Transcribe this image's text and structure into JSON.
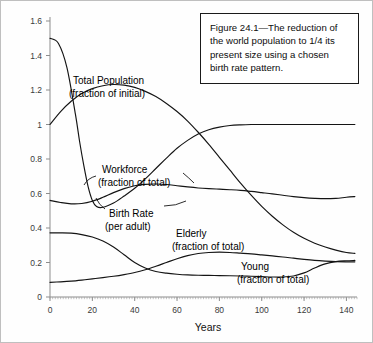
{
  "figure": {
    "caption": "Figure 24.1—The reduction of the world population to 1/4 its present size using a chosen birth rate pattern."
  },
  "chart_data": {
    "type": "line",
    "title": "",
    "xlabel": "Years",
    "ylabel": "",
    "xlim": [
      0,
      145
    ],
    "ylim": [
      0,
      1.6
    ],
    "xticks": [
      0,
      20,
      40,
      60,
      80,
      100,
      120,
      140
    ],
    "xtick_labels": [
      "0",
      "20",
      "40",
      "60",
      "80",
      "100",
      "120",
      "140"
    ],
    "yticks": [
      0,
      0.2,
      0.4,
      0.6,
      0.8,
      1,
      1.2,
      1.4,
      1.6
    ],
    "ytick_labels": [
      "0",
      "0.2",
      "0.4",
      "0.6",
      "0.8",
      "1",
      "1.2",
      "1.4",
      "1.6"
    ],
    "grid": false,
    "legend_position": "inline-annotations",
    "line_color": "#141414",
    "series": [
      {
        "name": "Birth Rate (per adult)",
        "label_line1": "Birth Rate",
        "label_line2": "(per adult)",
        "x": [
          0,
          4,
          8,
          12,
          14,
          16,
          18,
          20,
          22,
          25,
          30,
          35,
          40,
          45,
          50,
          55,
          60,
          65,
          70,
          75,
          80,
          85,
          90,
          95,
          100,
          110,
          120,
          130,
          140,
          144
        ],
        "y": [
          1.5,
          1.47,
          1.33,
          1.06,
          0.9,
          0.76,
          0.64,
          0.56,
          0.525,
          0.52,
          0.545,
          0.585,
          0.63,
          0.685,
          0.745,
          0.805,
          0.862,
          0.908,
          0.945,
          0.97,
          0.985,
          0.994,
          0.998,
          1.0,
          1.0,
          1.0,
          1.0,
          1.0,
          1.0,
          1.0
        ]
      },
      {
        "name": "Total Population (fraction of initial)",
        "label_line1": "Total Population",
        "label_line2": "(fraction of initial)",
        "x": [
          0,
          5,
          10,
          15,
          20,
          25,
          30,
          35,
          40,
          45,
          50,
          55,
          60,
          65,
          70,
          75,
          80,
          85,
          90,
          95,
          100,
          105,
          110,
          115,
          120,
          125,
          130,
          135,
          140,
          144
        ],
        "y": [
          1.0,
          1.075,
          1.135,
          1.18,
          1.208,
          1.225,
          1.232,
          1.228,
          1.215,
          1.192,
          1.162,
          1.122,
          1.075,
          1.02,
          0.955,
          0.885,
          0.81,
          0.735,
          0.66,
          0.59,
          0.525,
          0.468,
          0.418,
          0.375,
          0.34,
          0.312,
          0.29,
          0.272,
          0.258,
          0.253
        ]
      },
      {
        "name": "Workforce (fraction of total)",
        "label_line1": "Workforce",
        "label_line2": "(fraction of total)",
        "x": [
          0,
          5,
          10,
          15,
          20,
          25,
          30,
          35,
          40,
          45,
          50,
          55,
          60,
          65,
          70,
          75,
          80,
          85,
          90,
          95,
          100,
          105,
          110,
          115,
          120,
          125,
          130,
          135,
          140,
          144
        ],
        "y": [
          0.56,
          0.548,
          0.54,
          0.542,
          0.555,
          0.578,
          0.605,
          0.628,
          0.645,
          0.653,
          0.655,
          0.652,
          0.645,
          0.638,
          0.632,
          0.628,
          0.625,
          0.622,
          0.618,
          0.612,
          0.605,
          0.598,
          0.59,
          0.582,
          0.576,
          0.572,
          0.57,
          0.572,
          0.578,
          0.582
        ]
      },
      {
        "name": "Young (fraction of total)",
        "label_line1": "Young",
        "label_line2": "(fraction of total)",
        "x": [
          0,
          5,
          10,
          15,
          20,
          25,
          30,
          35,
          40,
          45,
          50,
          55,
          60,
          65,
          70,
          75,
          80,
          85,
          90,
          95,
          100,
          105,
          110,
          115,
          120,
          125,
          130,
          135,
          140,
          144
        ],
        "y": [
          0.372,
          0.372,
          0.37,
          0.362,
          0.348,
          0.325,
          0.29,
          0.245,
          0.2,
          0.168,
          0.148,
          0.138,
          0.132,
          0.128,
          0.126,
          0.125,
          0.124,
          0.123,
          0.122,
          0.12,
          0.118,
          0.116,
          0.116,
          0.122,
          0.14,
          0.168,
          0.192,
          0.205,
          0.21,
          0.212
        ]
      },
      {
        "name": "Elderly (fraction of total)",
        "label_line1": "Elderly",
        "label_line2": "(fraction of total)",
        "x": [
          0,
          5,
          10,
          15,
          20,
          25,
          30,
          35,
          40,
          45,
          50,
          55,
          60,
          65,
          70,
          75,
          80,
          85,
          90,
          95,
          100,
          105,
          110,
          115,
          120,
          125,
          130,
          135,
          140,
          144
        ],
        "y": [
          0.085,
          0.088,
          0.092,
          0.098,
          0.105,
          0.112,
          0.12,
          0.13,
          0.142,
          0.158,
          0.178,
          0.2,
          0.222,
          0.24,
          0.252,
          0.258,
          0.26,
          0.258,
          0.254,
          0.25,
          0.244,
          0.238,
          0.232,
          0.225,
          0.218,
          0.212,
          0.208,
          0.205,
          0.204,
          0.204
        ]
      }
    ]
  }
}
